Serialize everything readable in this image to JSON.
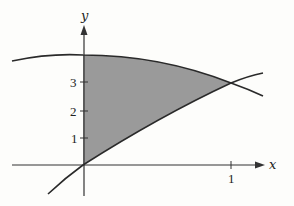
{
  "figure": {
    "axes": {
      "x_label": "x",
      "y_label": "y",
      "x_ticks": [
        {
          "value": 1,
          "label": "1"
        }
      ],
      "y_ticks": [
        {
          "value": 1,
          "label": "1"
        },
        {
          "value": 2,
          "label": "2"
        },
        {
          "value": 3,
          "label": "3"
        }
      ]
    },
    "curves": [
      {
        "name": "upper-curve",
        "description": "concave-down curve, y≈3.9 at x=0, passes through intersection (1,3)"
      },
      {
        "name": "lower-curve",
        "description": "increasing curve through origin (0,0) and intersection (1,3)"
      }
    ],
    "intersection_point": {
      "x": 1,
      "y": 3
    },
    "shaded_region": {
      "x_from": 0,
      "x_to": 1,
      "fill": "#9a9a9a"
    },
    "colors": {
      "curve": "#2a2a2a",
      "axis": "#333333",
      "shading": "#9a9a9a",
      "background": "#fdfdfb"
    }
  }
}
